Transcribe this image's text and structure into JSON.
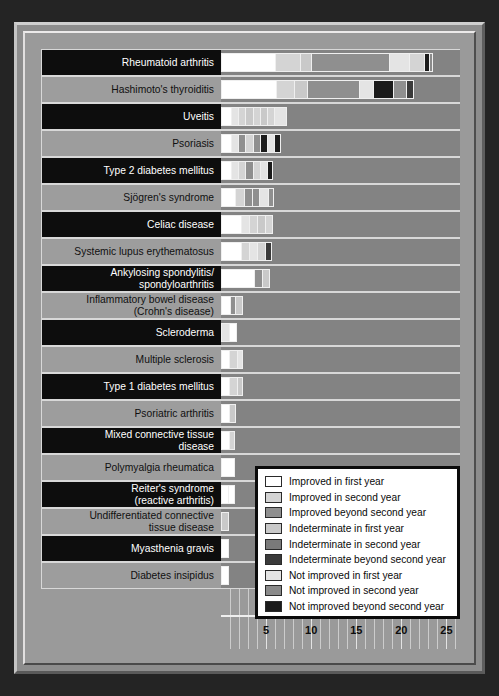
{
  "chart_data": {
    "type": "bar",
    "orientation": "horizontal",
    "stacked": true,
    "title": "",
    "xlabel": "",
    "ylabel": "",
    "xlim": [
      0,
      26.5
    ],
    "xticks": [
      5,
      10,
      15,
      20,
      25
    ],
    "grid": true,
    "legend_position": "inside-bottom-right",
    "categories": [
      "Rheumatoid arthritis",
      "Hashimoto's thyroiditis",
      "Uveitis",
      "Psoriasis",
      "Type 2 diabetes mellitus",
      "Sjögren's syndrome",
      "Celiac disease",
      "Systemic lupus erythematosus",
      "Ankylosing spondylitis/ spondyloarthritis",
      "Inflammatory bowel disease (Crohn's disease)",
      "Scleroderma",
      "Multiple sclerosis",
      "Type 1 diabetes mellitus",
      "Psoriatric arthritis",
      "Mixed connective tissue disease",
      "Polymyalgia rheumatica",
      "Reiter's syndrome (reactive arthritis)",
      "Undifferentiated connective tissue disease",
      "Myasthenia gravis",
      "Diabetes insipidus"
    ],
    "series": [
      {
        "name": "Improved in first year",
        "color": "#ffffff",
        "values": [
          6,
          6,
          1,
          1,
          1,
          1,
          2,
          2,
          4,
          1,
          1,
          1,
          1,
          1,
          1,
          1,
          1,
          0,
          0,
          0
        ]
      },
      {
        "name": "Improved in second year",
        "color": "#d4d4d4",
        "values": [
          3,
          2,
          1,
          1,
          1,
          1,
          1,
          1,
          1,
          0,
          0,
          1,
          1,
          1,
          1,
          0,
          0,
          0,
          0,
          0
        ]
      },
      {
        "name": "Improved beyond second year",
        "color": "#8f8f8f",
        "values": [
          9,
          7,
          0,
          2,
          0,
          1,
          0,
          1,
          0,
          1,
          0,
          0,
          0,
          0,
          0,
          0,
          0,
          0,
          0,
          0
        ]
      },
      {
        "name": "Indeterminate in first year",
        "color": "#c9c9c9",
        "values": [
          4,
          2,
          3,
          1,
          1,
          1,
          1,
          1,
          0,
          1,
          0,
          0,
          1,
          1,
          1,
          1,
          1,
          1,
          1,
          1
        ]
      },
      {
        "name": "Indeterminate in second year",
        "color": "#7a7a7a",
        "values": [
          1,
          1,
          1,
          1,
          0,
          0,
          0,
          0,
          0,
          0,
          0,
          0,
          0,
          0,
          0,
          0,
          0,
          0,
          0,
          0
        ]
      },
      {
        "name": "Indeterminate beyond second year",
        "color": "#3a3a3a",
        "values": [
          0,
          3,
          0,
          1,
          1,
          0,
          0,
          1,
          0,
          0,
          0,
          0,
          0,
          0,
          0,
          0,
          0,
          0,
          0,
          0
        ]
      },
      {
        "name": "Not improved in first year",
        "color": "#e4e4e4",
        "values": [
          1,
          1,
          1,
          1,
          1,
          1,
          1,
          0,
          0,
          0,
          1,
          1,
          0,
          0,
          1,
          1,
          0,
          0,
          0,
          0
        ]
      },
      {
        "name": "Not improved in second year",
        "color": "#8a8a8a",
        "values": [
          1,
          1,
          1,
          0,
          0,
          0,
          0,
          0,
          0,
          0,
          0,
          0,
          0,
          0,
          0,
          0,
          0,
          0,
          0,
          0
        ]
      },
      {
        "name": "Not improved beyond second year",
        "color": "#1b1b1b",
        "values": [
          1,
          2,
          0,
          1,
          1,
          0,
          0,
          0,
          0,
          0,
          0,
          0,
          0,
          0,
          0,
          0,
          0,
          0,
          0,
          0
        ]
      }
    ],
    "bar_segments": [
      {
        "category": "Rheumatoid arthritis",
        "segments": [
          {
            "series": 0,
            "length": 6.0
          },
          {
            "series": 1,
            "length": 2.8
          },
          {
            "series": 3,
            "length": 1.2
          },
          {
            "series": 2,
            "length": 8.6
          },
          {
            "series": 6,
            "length": 2.3
          },
          {
            "series": 1,
            "length": 1.6
          },
          {
            "series": 8,
            "length": 0.6
          },
          {
            "series": 7,
            "length": 0.4
          }
        ]
      },
      {
        "category": "Hashimoto's thyroiditis",
        "segments": [
          {
            "series": 0,
            "length": 6.1
          },
          {
            "series": 1,
            "length": 2.0
          },
          {
            "series": 3,
            "length": 1.4
          },
          {
            "series": 2,
            "length": 5.8
          },
          {
            "series": 6,
            "length": 1.6
          },
          {
            "series": 8,
            "length": 2.2
          },
          {
            "series": 2,
            "length": 1.4
          },
          {
            "series": 5,
            "length": 0.9
          }
        ]
      },
      {
        "category": "Uveitis",
        "segments": [
          {
            "series": 0,
            "length": 1.1
          },
          {
            "series": 6,
            "length": 0.8
          },
          {
            "series": 1,
            "length": 0.8
          },
          {
            "series": 3,
            "length": 0.8
          },
          {
            "series": 1,
            "length": 0.8
          },
          {
            "series": 3,
            "length": 0.8
          },
          {
            "series": 1,
            "length": 0.8
          },
          {
            "series": 6,
            "length": 1.4
          }
        ]
      },
      {
        "category": "Psoriasis",
        "segments": [
          {
            "series": 0,
            "length": 1.1
          },
          {
            "series": 6,
            "length": 0.8
          },
          {
            "series": 2,
            "length": 0.8
          },
          {
            "series": 1,
            "length": 0.8
          },
          {
            "series": 2,
            "length": 0.8
          },
          {
            "series": 8,
            "length": 0.8
          },
          {
            "series": 6,
            "length": 0.8
          },
          {
            "series": 8,
            "length": 0.8
          }
        ]
      },
      {
        "category": "Type 2 diabetes mellitus",
        "segments": [
          {
            "series": 0,
            "length": 1.1
          },
          {
            "series": 6,
            "length": 0.8
          },
          {
            "series": 1,
            "length": 0.8
          },
          {
            "series": 2,
            "length": 0.8
          },
          {
            "series": 1,
            "length": 0.8
          },
          {
            "series": 6,
            "length": 0.8
          },
          {
            "series": 8,
            "length": 0.7
          }
        ]
      },
      {
        "category": "Sjögren's syndrome",
        "segments": [
          {
            "series": 0,
            "length": 1.6
          },
          {
            "series": 1,
            "length": 1.0
          },
          {
            "series": 2,
            "length": 0.8
          },
          {
            "series": 2,
            "length": 0.8
          },
          {
            "series": 6,
            "length": 1.0
          },
          {
            "series": 2,
            "length": 0.7
          }
        ]
      },
      {
        "category": "Celiac disease",
        "segments": [
          {
            "series": 0,
            "length": 2.2
          },
          {
            "series": 6,
            "length": 0.9
          },
          {
            "series": 1,
            "length": 0.9
          },
          {
            "series": 3,
            "length": 0.9
          },
          {
            "series": 1,
            "length": 0.9
          }
        ]
      },
      {
        "category": "Systemic lupus erythematosus",
        "segments": [
          {
            "series": 0,
            "length": 2.2
          },
          {
            "series": 1,
            "length": 0.9
          },
          {
            "series": 6,
            "length": 0.9
          },
          {
            "series": 1,
            "length": 0.9
          },
          {
            "series": 5,
            "length": 0.8
          }
        ]
      },
      {
        "category": "Ankylosing spondylitis/ spondyloarthritis",
        "segments": [
          {
            "series": 0,
            "length": 3.7
          },
          {
            "series": 2,
            "length": 0.8
          },
          {
            "series": 3,
            "length": 0.9
          }
        ]
      },
      {
        "category": "Inflammatory bowel disease (Crohn's disease)",
        "segments": [
          {
            "series": 0,
            "length": 1.0
          },
          {
            "series": 2,
            "length": 0.6
          },
          {
            "series": 3,
            "length": 0.8
          }
        ]
      },
      {
        "category": "Scleroderma",
        "segments": [
          {
            "series": 6,
            "length": 0.9
          },
          {
            "series": 0,
            "length": 0.9
          }
        ]
      },
      {
        "category": "Multiple sclerosis",
        "segments": [
          {
            "series": 0,
            "length": 0.9
          },
          {
            "series": 1,
            "length": 0.9
          },
          {
            "series": 6,
            "length": 0.6
          }
        ]
      },
      {
        "category": "Type 1 diabetes mellitus",
        "segments": [
          {
            "series": 0,
            "length": 0.9
          },
          {
            "series": 1,
            "length": 0.9
          },
          {
            "series": 3,
            "length": 0.6
          }
        ]
      },
      {
        "category": "Psoriatric arthritis",
        "segments": [
          {
            "series": 0,
            "length": 0.9
          },
          {
            "series": 3,
            "length": 0.8
          }
        ]
      },
      {
        "category": "Mixed connective tissue disease",
        "segments": [
          {
            "series": 0,
            "length": 0.9
          },
          {
            "series": 1,
            "length": 0.7
          }
        ]
      },
      {
        "category": "Polymyalgia rheumatica",
        "segments": [
          {
            "series": 0,
            "length": 1.6
          }
        ]
      },
      {
        "category": "Reiter's syndrome (reactive arthritis)",
        "segments": [
          {
            "series": 0,
            "length": 0.8
          },
          {
            "series": 0,
            "length": 0.8
          }
        ]
      },
      {
        "category": "Undifferentiated connective tissue disease",
        "segments": [
          {
            "series": 3,
            "length": 0.9
          }
        ]
      },
      {
        "category": "Myasthenia gravis",
        "segments": [
          {
            "series": 0,
            "length": 0.9
          }
        ]
      },
      {
        "category": "Diabetes insipidus",
        "segments": [
          {
            "series": 0,
            "length": 0.9
          }
        ]
      }
    ]
  },
  "labels": [
    {
      "lines": [
        "Rheumatoid arthritis"
      ],
      "style": "dark"
    },
    {
      "lines": [
        "Hashimoto's thyroiditis"
      ],
      "style": "lite"
    },
    {
      "lines": [
        "Uveitis"
      ],
      "style": "dark"
    },
    {
      "lines": [
        "Psoriasis"
      ],
      "style": "lite"
    },
    {
      "lines": [
        "Type 2 diabetes mellitus"
      ],
      "style": "dark"
    },
    {
      "lines": [
        "Sjögren's syndrome"
      ],
      "style": "lite"
    },
    {
      "lines": [
        "Celiac disease"
      ],
      "style": "dark"
    },
    {
      "lines": [
        "Systemic lupus erythematosus"
      ],
      "style": "lite"
    },
    {
      "lines": [
        "Ankylosing spondylitis/",
        "spondyloarthritis"
      ],
      "style": "dark"
    },
    {
      "lines": [
        "Inflammatory bowel disease",
        "(Crohn's disease)"
      ],
      "style": "lite"
    },
    {
      "lines": [
        "Scleroderma"
      ],
      "style": "dark"
    },
    {
      "lines": [
        "Multiple sclerosis"
      ],
      "style": "lite"
    },
    {
      "lines": [
        "Type 1 diabetes mellitus"
      ],
      "style": "dark"
    },
    {
      "lines": [
        "Psoriatric arthritis"
      ],
      "style": "lite"
    },
    {
      "lines": [
        "Mixed connective tissue",
        "disease"
      ],
      "style": "dark"
    },
    {
      "lines": [
        "Polymyalgia rheumatica"
      ],
      "style": "lite"
    },
    {
      "lines": [
        "Reiter's syndrome",
        "(reactive arthritis)"
      ],
      "style": "dark"
    },
    {
      "lines": [
        "Undifferentiated connective",
        "tissue disease"
      ],
      "style": "lite"
    },
    {
      "lines": [
        "Myasthenia gravis"
      ],
      "style": "dark"
    },
    {
      "lines": [
        "Diabetes insipidus"
      ],
      "style": "lite"
    }
  ],
  "legend": {
    "items": [
      {
        "label": "Improved in first year",
        "color": "#ffffff"
      },
      {
        "label": "Improved in second year",
        "color": "#d4d4d4"
      },
      {
        "label": "Improved beyond second year",
        "color": "#8f8f8f"
      },
      {
        "label": "Indeterminate in first year",
        "color": "#c9c9c9"
      },
      {
        "label": "Indeterminate in second year",
        "color": "#7a7a7a"
      },
      {
        "label": "Indeterminate beyond second year",
        "color": "#3a3a3a"
      },
      {
        "label": "Not improved in first year",
        "color": "#e4e4e4"
      },
      {
        "label": "Not improved in second year",
        "color": "#8a8a8a"
      },
      {
        "label": "Not improved beyond second year",
        "color": "#1b1b1b"
      }
    ]
  },
  "colors": {
    "page_background": "#242424",
    "frame": "#8d8d8d",
    "panel": "#9a9a9a",
    "plot_background": "#838383",
    "gridline": "#d5d5d5",
    "label_dark_bg": "#0d0d0d",
    "label_lite_bg": "#9d9d9d"
  }
}
